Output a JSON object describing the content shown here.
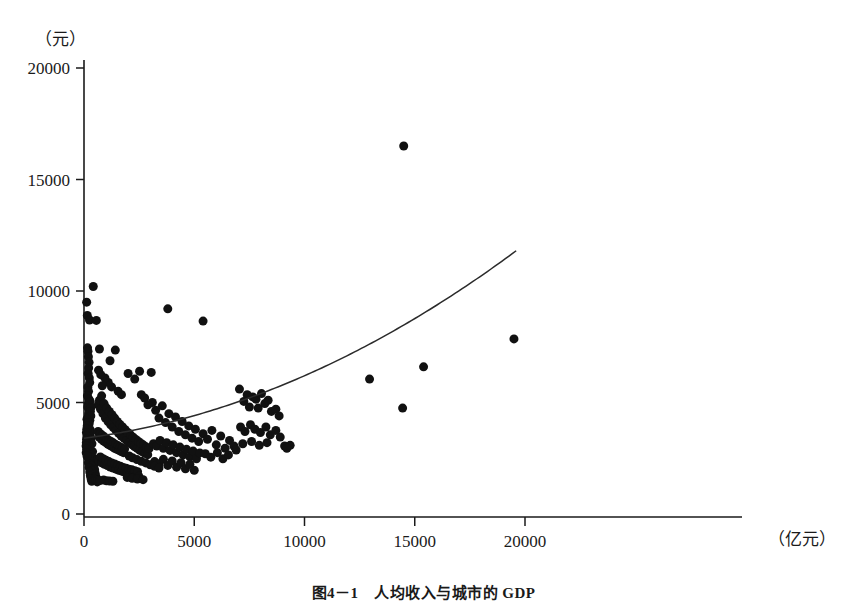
{
  "figure": {
    "caption": "图4－1　人均收入与城市的 GDP",
    "y_axis_unit": "（元）",
    "x_axis_unit": "（亿元）"
  },
  "chart_data": {
    "type": "scatter",
    "title": "图4－1　人均收入与城市的 GDP",
    "xlabel": "（亿元）",
    "ylabel": "（元）",
    "xlim": [
      0,
      20800
    ],
    "ylim": [
      0,
      20600
    ],
    "xticks": [
      0,
      5000,
      10000,
      15000,
      20000
    ],
    "yticks": [
      0,
      5000,
      10000,
      15000,
      20000
    ],
    "xtick_labels": [
      "0",
      "5000",
      "10000",
      "15000",
      "20000"
    ],
    "ytick_labels": [
      "0",
      "5000",
      "10000",
      "15000",
      "20000"
    ],
    "grid": false,
    "legend": false,
    "marker_color": "#111111",
    "marker_size": 9,
    "series": [
      {
        "name": "城市样本",
        "type": "scatter",
        "points": [
          [
            120,
            9500
          ],
          [
            150,
            8900
          ],
          [
            420,
            10200
          ],
          [
            250,
            8700
          ],
          [
            560,
            8680
          ],
          [
            700,
            7400
          ],
          [
            1180,
            6870
          ],
          [
            1420,
            7350
          ],
          [
            2000,
            6300
          ],
          [
            2300,
            6050
          ],
          [
            2520,
            6400
          ],
          [
            3050,
            6350
          ],
          [
            3800,
            9200
          ],
          [
            5400,
            8650
          ],
          [
            160,
            7450
          ],
          [
            180,
            7300
          ],
          [
            200,
            7050
          ],
          [
            230,
            6800
          ],
          [
            210,
            6550
          ],
          [
            190,
            6300
          ],
          [
            240,
            6100
          ],
          [
            260,
            5900
          ],
          [
            175,
            5700
          ],
          [
            205,
            5500
          ],
          [
            155,
            5300
          ],
          [
            225,
            5150
          ],
          [
            195,
            4950
          ],
          [
            170,
            4800
          ],
          [
            250,
            4650
          ],
          [
            215,
            4500
          ],
          [
            185,
            4350
          ],
          [
            265,
            4200
          ],
          [
            235,
            4050
          ],
          [
            160,
            3900
          ],
          [
            280,
            3780
          ],
          [
            300,
            3650
          ],
          [
            210,
            3520
          ],
          [
            330,
            3400
          ],
          [
            190,
            3280
          ],
          [
            360,
            3150
          ],
          [
            240,
            3030
          ],
          [
            140,
            2900
          ],
          [
            390,
            2800
          ],
          [
            270,
            2700
          ],
          [
            175,
            2600
          ],
          [
            420,
            2500
          ],
          [
            310,
            2400
          ],
          [
            200,
            2300
          ],
          [
            450,
            2220
          ],
          [
            340,
            2150
          ],
          [
            230,
            2080
          ],
          [
            480,
            2000
          ],
          [
            370,
            1940
          ],
          [
            260,
            1880
          ],
          [
            510,
            1820
          ],
          [
            400,
            1770
          ],
          [
            290,
            1720
          ],
          [
            540,
            1670
          ],
          [
            430,
            1620
          ],
          [
            320,
            1580
          ],
          [
            570,
            1540
          ],
          [
            460,
            1500
          ],
          [
            350,
            1470
          ],
          [
            600,
            1440
          ],
          [
            650,
            4900
          ],
          [
            700,
            5100
          ],
          [
            750,
            4700
          ],
          [
            800,
            5300
          ],
          [
            860,
            4500
          ],
          [
            910,
            4950
          ],
          [
            970,
            4300
          ],
          [
            1030,
            4750
          ],
          [
            1090,
            4150
          ],
          [
            1150,
            4600
          ],
          [
            1210,
            4000
          ],
          [
            1270,
            4450
          ],
          [
            1330,
            3880
          ],
          [
            1390,
            4300
          ],
          [
            1450,
            3750
          ],
          [
            1510,
            4150
          ],
          [
            1570,
            3620
          ],
          [
            1630,
            4020
          ],
          [
            1690,
            3500
          ],
          [
            1750,
            3900
          ],
          [
            1810,
            3400
          ],
          [
            1870,
            3780
          ],
          [
            1930,
            3300
          ],
          [
            1990,
            3660
          ],
          [
            2050,
            3200
          ],
          [
            2110,
            3550
          ],
          [
            2170,
            3110
          ],
          [
            2230,
            3440
          ],
          [
            2290,
            3020
          ],
          [
            2350,
            3340
          ],
          [
            2410,
            2940
          ],
          [
            2470,
            3250
          ],
          [
            2530,
            2860
          ],
          [
            2590,
            3160
          ],
          [
            2650,
            2790
          ],
          [
            2710,
            3080
          ],
          [
            2770,
            2720
          ],
          [
            2830,
            3000
          ],
          [
            2890,
            2660
          ],
          [
            2950,
            2930
          ],
          [
            640,
            3700
          ],
          [
            690,
            3450
          ],
          [
            740,
            3600
          ],
          [
            790,
            3350
          ],
          [
            840,
            3520
          ],
          [
            890,
            3270
          ],
          [
            940,
            3440
          ],
          [
            990,
            3200
          ],
          [
            1040,
            3370
          ],
          [
            1090,
            3130
          ],
          [
            1140,
            3300
          ],
          [
            1190,
            3070
          ],
          [
            1240,
            3240
          ],
          [
            1290,
            3010
          ],
          [
            1340,
            3180
          ],
          [
            1390,
            2950
          ],
          [
            1440,
            3120
          ],
          [
            1490,
            2900
          ],
          [
            1540,
            3060
          ],
          [
            1590,
            2850
          ],
          [
            1640,
            3010
          ],
          [
            1690,
            2800
          ],
          [
            1740,
            2960
          ],
          [
            1790,
            2750
          ],
          [
            1840,
            2910
          ],
          [
            620,
            2450
          ],
          [
            680,
            2380
          ],
          [
            740,
            2560
          ],
          [
            800,
            2300
          ],
          [
            870,
            2480
          ],
          [
            930,
            2230
          ],
          [
            1000,
            2410
          ],
          [
            1060,
            2170
          ],
          [
            1130,
            2350
          ],
          [
            1190,
            2110
          ],
          [
            1260,
            2290
          ],
          [
            1320,
            2060
          ],
          [
            1390,
            2240
          ],
          [
            1450,
            2010
          ],
          [
            1520,
            2190
          ],
          [
            1580,
            1960
          ],
          [
            1650,
            2140
          ],
          [
            1710,
            1920
          ],
          [
            1780,
            2090
          ],
          [
            1840,
            1880
          ],
          [
            1910,
            2050
          ],
          [
            1970,
            1840
          ],
          [
            2040,
            2010
          ],
          [
            2100,
            1800
          ],
          [
            2170,
            1980
          ],
          [
            2230,
            1760
          ],
          [
            2300,
            1940
          ],
          [
            2360,
            1720
          ],
          [
            2430,
            1900
          ],
          [
            2490,
            1690
          ],
          [
            3100,
            5000
          ],
          [
            3250,
            4650
          ],
          [
            3400,
            4300
          ],
          [
            3550,
            4850
          ],
          [
            3700,
            4100
          ],
          [
            3850,
            4500
          ],
          [
            4000,
            3900
          ],
          [
            4150,
            4350
          ],
          [
            4300,
            3700
          ],
          [
            4450,
            4150
          ],
          [
            4600,
            3550
          ],
          [
            4750,
            3950
          ],
          [
            4900,
            3400
          ],
          [
            5050,
            3800
          ],
          [
            5200,
            3250
          ],
          [
            3150,
            3150
          ],
          [
            3300,
            3050
          ],
          [
            3450,
            3300
          ],
          [
            3600,
            2950
          ],
          [
            3750,
            3200
          ],
          [
            3900,
            2850
          ],
          [
            4050,
            3100
          ],
          [
            4200,
            2750
          ],
          [
            4350,
            3000
          ],
          [
            4500,
            2650
          ],
          [
            4650,
            2900
          ],
          [
            4800,
            2560
          ],
          [
            4950,
            2820
          ],
          [
            5100,
            2480
          ],
          [
            5250,
            2740
          ],
          [
            3200,
            2350
          ],
          [
            3400,
            2250
          ],
          [
            3600,
            2450
          ],
          [
            3800,
            2180
          ],
          [
            4000,
            2380
          ],
          [
            4200,
            2100
          ],
          [
            4400,
            2300
          ],
          [
            4600,
            2030
          ],
          [
            4800,
            2230
          ],
          [
            5000,
            1960
          ],
          [
            5400,
            3600
          ],
          [
            5600,
            3350
          ],
          [
            5800,
            3750
          ],
          [
            6000,
            3100
          ],
          [
            6200,
            3500
          ],
          [
            6400,
            2950
          ],
          [
            6600,
            3300
          ],
          [
            6800,
            3050
          ],
          [
            6900,
            2870
          ],
          [
            5500,
            2700
          ],
          [
            5750,
            2550
          ],
          [
            6050,
            2750
          ],
          [
            6300,
            2480
          ],
          [
            6550,
            2650
          ],
          [
            7050,
            5600
          ],
          [
            7250,
            5050
          ],
          [
            7400,
            5350
          ],
          [
            7500,
            4800
          ],
          [
            7650,
            5250
          ],
          [
            7800,
            5150
          ],
          [
            7900,
            4750
          ],
          [
            8050,
            5400
          ],
          [
            8200,
            4950
          ],
          [
            8350,
            5100
          ],
          [
            8500,
            4600
          ],
          [
            8700,
            4700
          ],
          [
            8850,
            4400
          ],
          [
            7100,
            3900
          ],
          [
            7300,
            3700
          ],
          [
            7550,
            4000
          ],
          [
            7750,
            3800
          ],
          [
            8000,
            3650
          ],
          [
            8250,
            3900
          ],
          [
            8450,
            3550
          ],
          [
            8700,
            3750
          ],
          [
            8900,
            3450
          ],
          [
            7200,
            3150
          ],
          [
            7600,
            3250
          ],
          [
            7950,
            3080
          ],
          [
            8300,
            3200
          ],
          [
            9100,
            3050
          ],
          [
            9350,
            3080
          ],
          [
            9200,
            2950
          ],
          [
            12950,
            6050
          ],
          [
            14500,
            16500
          ],
          [
            14450,
            4750
          ],
          [
            15400,
            6600
          ],
          [
            19500,
            7850
          ],
          [
            280,
            5050
          ],
          [
            320,
            4780
          ],
          [
            290,
            4600
          ],
          [
            310,
            4400
          ],
          [
            135,
            4250
          ],
          [
            165,
            4100
          ],
          [
            145,
            3950
          ],
          [
            125,
            3800
          ],
          [
            110,
            3650
          ],
          [
            130,
            3500
          ],
          [
            115,
            3350
          ],
          [
            105,
            3200
          ],
          [
            95,
            3050
          ],
          [
            125,
            2900
          ],
          [
            100,
            2750
          ],
          [
            135,
            2600
          ],
          [
            2600,
            5350
          ],
          [
            2750,
            5200
          ],
          [
            2900,
            4900
          ],
          [
            1550,
            5500
          ],
          [
            1700,
            5350
          ],
          [
            1250,
            5700
          ],
          [
            1100,
            5900
          ],
          [
            950,
            6100
          ],
          [
            830,
            5750
          ],
          [
            760,
            6250
          ],
          [
            660,
            6450
          ],
          [
            2050,
            2600
          ],
          [
            2200,
            2520
          ],
          [
            2400,
            2440
          ],
          [
            2600,
            2360
          ],
          [
            2800,
            2290
          ],
          [
            3000,
            2210
          ],
          [
            3200,
            2140
          ],
          [
            3400,
            2060
          ],
          [
            1960,
            1640
          ],
          [
            2180,
            1600
          ],
          [
            2420,
            1570
          ],
          [
            2680,
            1540
          ],
          [
            890,
            1520
          ],
          [
            1020,
            1490
          ],
          [
            1160,
            1480
          ],
          [
            1310,
            1470
          ],
          [
            470,
            1560
          ],
          [
            530,
            1530
          ],
          [
            620,
            1510
          ],
          [
            720,
            1500
          ]
        ]
      },
      {
        "name": "拟合曲线",
        "type": "line",
        "description": "二次拟合趋势线",
        "x_range": [
          0,
          19600
        ],
        "fit": {
          "a": 3400,
          "b": 0.125,
          "c": 1.55e-05
        }
      }
    ]
  }
}
